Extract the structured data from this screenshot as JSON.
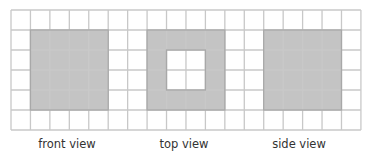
{
  "grid": {
    "cols": 18,
    "rows": 6,
    "cell_w": 19.44,
    "cell_h": 20,
    "line_color": "#c8c8c8",
    "fill_color": "#c4c4c4",
    "shaded_border": "#a8a8a8"
  },
  "views": [
    {
      "name": "front",
      "label": "front view",
      "col_start": 1,
      "col_end": 4,
      "row_start": 1,
      "row_end": 4,
      "holes": [],
      "label_x": 67
    },
    {
      "name": "top",
      "label": "top view",
      "col_start": 7,
      "col_end": 10,
      "row_start": 1,
      "row_end": 4,
      "holes": [
        [
          8,
          2
        ],
        [
          9,
          2
        ],
        [
          8,
          3
        ],
        [
          9,
          3
        ]
      ],
      "label_x": 184
    },
    {
      "name": "side",
      "label": "side view",
      "col_start": 13,
      "col_end": 16,
      "row_start": 1,
      "row_end": 4,
      "holes": [],
      "label_x": 299
    }
  ]
}
